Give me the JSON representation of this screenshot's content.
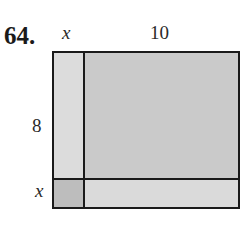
{
  "problem": {
    "number": "64.",
    "labels": {
      "top_left_width": "x",
      "top_right_width": "10",
      "left_top_height": "8",
      "left_bottom_height": "x"
    },
    "regions": [
      {
        "name": "x-by-8",
        "fill": "#dcdcdc"
      },
      {
        "name": "10-by-8",
        "fill": "#cacaca"
      },
      {
        "name": "x-by-x",
        "fill": "#bdbdbd"
      },
      {
        "name": "10-by-x",
        "fill": "#dadada"
      }
    ]
  }
}
